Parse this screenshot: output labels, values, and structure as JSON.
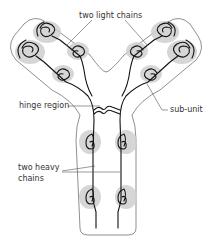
{
  "diagram": {
    "labels": {
      "light_chains": "two light chains",
      "hinge": "hinge region",
      "subunit": "sub-unit",
      "heavy_chains_line1": "two heavy",
      "heavy_chains_line2": "chains"
    },
    "colors": {
      "chain": "#111111",
      "subunit_fill": "#cfcfcf",
      "outline": "#444444",
      "text": "#333333"
    }
  }
}
